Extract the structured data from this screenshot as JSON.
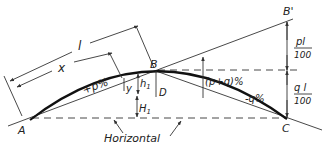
{
  "diagram": {
    "type": "vertical-curve-geometry",
    "points": {
      "A": "A",
      "B": "B",
      "B_prime": "B'",
      "C": "C",
      "D": "D"
    },
    "dimensions": {
      "l": "l",
      "x": "x",
      "y": "y",
      "h1": "h",
      "h1_sub": "1",
      "H1": "H",
      "H1_sub": "1"
    },
    "grades": {
      "entry": "+p%",
      "exit": "-q%",
      "algebraic_difference": "(p+q)%"
    },
    "fractions": {
      "pl_num": "pl",
      "pl_den": "100",
      "ql_num": "q l",
      "ql_den": "100"
    },
    "annotations": {
      "horizontal": "Horizontal"
    },
    "colors": {
      "line": "#333333",
      "curve": "#111111",
      "background": "#ffffff"
    }
  }
}
